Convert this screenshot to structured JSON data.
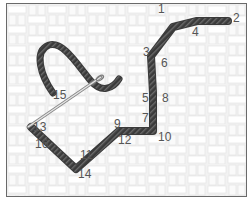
{
  "diagram": {
    "type": "stitch-diagram",
    "background": "woven fabric (basketweave) grid",
    "thread_color": "#3a3a3a",
    "needle_color": "#9a9a9a",
    "points": [
      {
        "n": "1",
        "x": 157,
        "y": 12
      },
      {
        "n": "2",
        "x": 233,
        "y": 20
      },
      {
        "n": "3",
        "x": 145,
        "y": 55
      },
      {
        "n": "4",
        "x": 192,
        "y": 32
      },
      {
        "n": "5",
        "x": 143,
        "y": 98
      },
      {
        "n": "6",
        "x": 160,
        "y": 63
      },
      {
        "n": "7",
        "x": 143,
        "y": 120
      },
      {
        "n": "8",
        "x": 165,
        "y": 98
      },
      {
        "n": "9",
        "x": 114,
        "y": 127
      },
      {
        "n": "10",
        "x": 163,
        "y": 138
      },
      {
        "n": "11",
        "x": 78,
        "y": 156
      },
      {
        "n": "12",
        "x": 118,
        "y": 145
      },
      {
        "n": "13",
        "x": 29,
        "y": 132
      },
      {
        "n": "14",
        "x": 77,
        "y": 178
      },
      {
        "n": "15",
        "x": 51,
        "y": 98
      },
      {
        "n": "16",
        "x": 33,
        "y": 148
      }
    ]
  }
}
